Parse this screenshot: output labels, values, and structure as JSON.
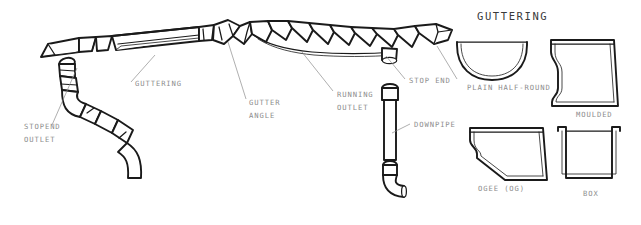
{
  "figure": {
    "title": "GUTTERING",
    "title_pos": {
      "x": 477,
      "y": 20
    }
  },
  "assembly_labels": [
    {
      "id": "stopend-outlet",
      "line1": "STOPEND",
      "line2": "OUTLET",
      "x": 24,
      "y": 129
    },
    {
      "id": "guttering",
      "line1": "GUTTERING",
      "line2": "",
      "x": 135,
      "y": 86
    },
    {
      "id": "gutter-angle",
      "line1": "GUTTER",
      "line2": "ANGLE",
      "x": 249,
      "y": 105
    },
    {
      "id": "running-outlet",
      "line1": "RUNNING",
      "line2": "OUTLET",
      "x": 337,
      "y": 97
    },
    {
      "id": "stop-end",
      "line1": "STOP END",
      "line2": "",
      "x": 409,
      "y": 83
    },
    {
      "id": "downpipe",
      "line1": "DOWNPIPE",
      "line2": "",
      "x": 414,
      "y": 127
    }
  ],
  "profiles": [
    {
      "id": "plain-half-round",
      "label": "PLAIN HALF-ROUND",
      "label_x": 467,
      "label_y": 90
    },
    {
      "id": "moulded",
      "label": "MOULDED",
      "label_x": 576,
      "label_y": 117
    },
    {
      "id": "ogee",
      "label": "OGEE (OG)",
      "label_x": 478,
      "label_y": 191
    },
    {
      "id": "box",
      "label": "BOX",
      "label_x": 583,
      "label_y": 196
    }
  ],
  "colors": {
    "ink": "#1a1a1a",
    "label": "#8d8d8d",
    "title": "#3a3a3a",
    "paper": "#ffffff"
  }
}
